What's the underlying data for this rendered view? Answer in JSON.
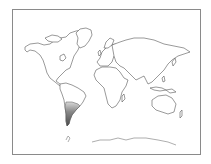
{
  "map": {
    "type": "world-outline",
    "highlighted_region": "Southern South America (Argentina / Chile)",
    "colors": {
      "background": "#ffffff",
      "frame": "#8a8a8a",
      "outline": "#555555",
      "highlight_dark": "#5a5a5a",
      "highlight_light": "#c8c8c8"
    }
  }
}
